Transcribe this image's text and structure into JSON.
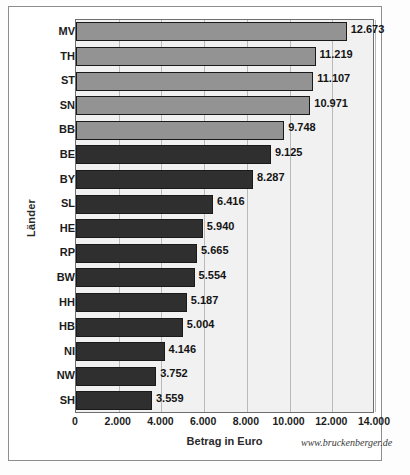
{
  "chart_data": {
    "type": "bar",
    "orientation": "horizontal",
    "title": "",
    "xlabel": "Betrag in Euro",
    "ylabel": "Länder",
    "xlim": [
      0,
      14000
    ],
    "xticks": [
      "0",
      "2.000",
      "4.000",
      "6.000",
      "8.000",
      "10.000",
      "12.000",
      "14.000"
    ],
    "xtick_values": [
      0,
      2000,
      4000,
      6000,
      8000,
      10000,
      12000,
      14000
    ],
    "grid": true,
    "legend": null,
    "categories": [
      "MV",
      "TH",
      "ST",
      "SN",
      "BB",
      "BE",
      "BY",
      "SL",
      "HE",
      "RP",
      "BW",
      "HH",
      "HB",
      "NI",
      "NW",
      "SH"
    ],
    "values": [
      12673,
      11219,
      11107,
      10971,
      9748,
      9125,
      8287,
      6416,
      5940,
      5665,
      5554,
      5187,
      5004,
      4146,
      3752,
      3559
    ],
    "value_labels": [
      "12.673",
      "11.219",
      "11.107",
      "10.971",
      "9.748",
      "9.125",
      "8.287",
      "6.416",
      "5.940",
      "5.665",
      "5.554",
      "5.187",
      "5.004",
      "4.146",
      "3.752",
      "3.559"
    ],
    "bar_styles": [
      "light",
      "light",
      "light",
      "light",
      "light",
      "dark",
      "dark",
      "dark",
      "dark",
      "dark",
      "dark",
      "dark",
      "dark",
      "dark",
      "dark",
      "dark"
    ],
    "colors": {
      "light_bar": "#939393",
      "dark_bar": "#2f2f2f",
      "bar_outline": "#1a1a1a",
      "plot_background": "#f1f1f1",
      "gridline": "#b9b9b9",
      "axis": "#6f6f6f"
    }
  },
  "watermark": "www.bruckenberger.de"
}
